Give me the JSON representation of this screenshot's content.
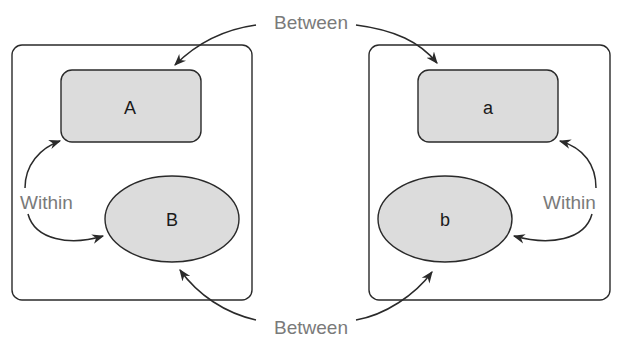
{
  "diagram": {
    "left_panel": {
      "rect_label": "A",
      "ellipse_label": "B",
      "within_label": "Within"
    },
    "right_panel": {
      "rect_label": "a",
      "ellipse_label": "b",
      "within_label": "Within"
    },
    "between_top_label": "Between",
    "between_bottom_label": "Between",
    "colors": {
      "shape_fill": "#dcdcdc",
      "stroke": "#2a2a2a",
      "relation_text": "#7a7a7a"
    }
  }
}
